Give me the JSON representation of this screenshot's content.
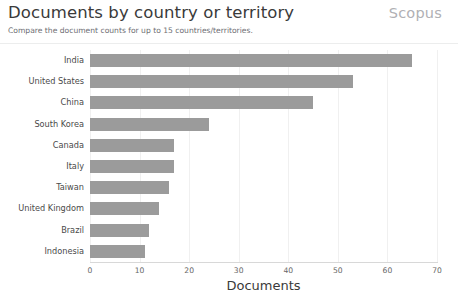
{
  "header": {
    "title": "Documents by country or territory",
    "brand": "Scopus",
    "subtitle": "Compare the document counts for up to 15 countries/territories."
  },
  "chart_data": {
    "type": "bar",
    "orientation": "horizontal",
    "title": "Documents by country or territory",
    "subtitle": "Compare the document counts for up to 15 countries/territories.",
    "xlabel": "Documents",
    "ylabel": "",
    "xlim": [
      0,
      70
    ],
    "xticks": [
      0,
      10,
      20,
      30,
      40,
      50,
      60,
      70
    ],
    "grid": true,
    "legend": false,
    "bar_color": "#9b9b9b",
    "categories": [
      "India",
      "United States",
      "China",
      "South Korea",
      "Canada",
      "Italy",
      "Taiwan",
      "United Kingdom",
      "Brazil",
      "Indonesia"
    ],
    "values": [
      65,
      53,
      45,
      24,
      17,
      17,
      16,
      14,
      12,
      11
    ]
  }
}
